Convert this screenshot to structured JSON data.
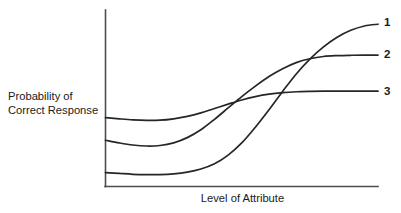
{
  "figure": {
    "background_color": "#ffffff",
    "line_color": "#262626",
    "axis_color": "#4d4d4d"
  },
  "axes": {
    "y_axis_title": "Probability of\nCorrect Response",
    "x_axis_title": "Level of Attribute"
  },
  "curve_labels": {
    "curve1": "1",
    "curve2": "2",
    "curve3": "3"
  },
  "chart_data": {
    "type": "line",
    "title": "",
    "subtitle": "",
    "xlabel": "Level of Attribute",
    "ylabel": "Probability of Correct Response",
    "grid": false,
    "legend": "right-of-curve-endpoints",
    "xlim": [
      0,
      1
    ],
    "ylim": [
      0,
      1
    ],
    "x_ticks": [],
    "y_ticks": [],
    "annotations": [
      {
        "text": "1",
        "x": 1.0,
        "y": 0.93
      },
      {
        "text": "2",
        "x": 1.0,
        "y": 0.75
      },
      {
        "text": "3",
        "x": 1.0,
        "y": 0.54
      }
    ],
    "x": [
      0.0,
      0.05,
      0.1,
      0.15,
      0.2,
      0.25,
      0.3,
      0.35,
      0.4,
      0.45,
      0.5,
      0.55,
      0.6,
      0.65,
      0.7,
      0.75,
      0.8,
      0.85,
      0.9,
      0.95,
      1.0
    ],
    "series": [
      {
        "name": "1",
        "label": "1",
        "description": "Low difficulty asymptote at left, steepest slope, highest upper asymptote",
        "values": [
          0.08,
          0.075,
          0.07,
          0.068,
          0.068,
          0.072,
          0.082,
          0.1,
          0.13,
          0.18,
          0.25,
          0.34,
          0.44,
          0.545,
          0.645,
          0.73,
          0.8,
          0.855,
          0.895,
          0.92,
          0.93
        ]
      },
      {
        "name": "2",
        "label": "2",
        "description": "Middle starting level, moderate slope, plateaus at 0.75",
        "values": [
          0.265,
          0.25,
          0.238,
          0.232,
          0.235,
          0.25,
          0.28,
          0.325,
          0.385,
          0.45,
          0.515,
          0.575,
          0.63,
          0.675,
          0.71,
          0.732,
          0.745,
          0.75,
          0.752,
          0.753,
          0.753
        ]
      },
      {
        "name": "3",
        "label": "3",
        "description": "Highest starting level, shallowest slope, plateaus lowest at 0.545",
        "values": [
          0.395,
          0.388,
          0.382,
          0.379,
          0.38,
          0.388,
          0.402,
          0.422,
          0.447,
          0.472,
          0.496,
          0.515,
          0.529,
          0.538,
          0.543,
          0.545,
          0.546,
          0.546,
          0.546,
          0.546,
          0.546
        ]
      }
    ]
  }
}
